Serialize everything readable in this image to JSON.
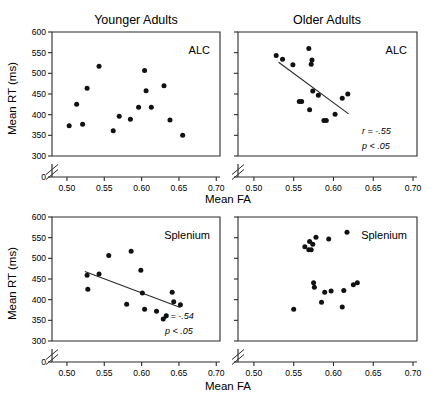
{
  "figure": {
    "name": "mean-rt-vs-mean-fa-scatter-matrix",
    "column_titles": [
      "Younger Adults",
      "Older Adults"
    ],
    "x_axis_label": "Mean FA",
    "y_axis_label": "Mean RT (ms)"
  },
  "axes": {
    "x_ticks": [
      "0.50",
      "0.55",
      "0.60",
      "0.65",
      "0.70"
    ],
    "x_tick_values": [
      0.5,
      0.55,
      0.6,
      0.65,
      0.7
    ],
    "x_min": 0.48,
    "x_max": 0.705,
    "y_ticks": [
      "0",
      "300",
      "350",
      "400",
      "450",
      "500",
      "550",
      "600"
    ],
    "y_tick_values": [
      0,
      300,
      350,
      400,
      450,
      500,
      550,
      600
    ],
    "y_min": 300,
    "y_max": 600,
    "axis_break": true,
    "grid": false
  },
  "chart_data": [
    {
      "type": "scatter",
      "panel": "top-left",
      "title": "Younger Adults",
      "roi_label": "ALC",
      "xlabel": "Mean FA",
      "ylabel": "Mean RT (ms)",
      "xlim": [
        0.48,
        0.705
      ],
      "ylim": [
        300,
        600
      ],
      "grid": false,
      "regression_line": null,
      "stats": null,
      "points": [
        {
          "x": 0.503,
          "y": 373
        },
        {
          "x": 0.513,
          "y": 425
        },
        {
          "x": 0.521,
          "y": 377
        },
        {
          "x": 0.527,
          "y": 464
        },
        {
          "x": 0.543,
          "y": 517
        },
        {
          "x": 0.562,
          "y": 361
        },
        {
          "x": 0.57,
          "y": 396
        },
        {
          "x": 0.585,
          "y": 389
        },
        {
          "x": 0.596,
          "y": 418
        },
        {
          "x": 0.604,
          "y": 507
        },
        {
          "x": 0.606,
          "y": 458
        },
        {
          "x": 0.613,
          "y": 418
        },
        {
          "x": 0.63,
          "y": 470
        },
        {
          "x": 0.638,
          "y": 387
        },
        {
          "x": 0.655,
          "y": 350
        }
      ]
    },
    {
      "type": "scatter",
      "panel": "top-right",
      "title": "Older Adults",
      "roi_label": "ALC",
      "xlabel": "Mean FA",
      "ylabel": "Mean RT (ms)",
      "xlim": [
        0.48,
        0.705
      ],
      "ylim": [
        300,
        600
      ],
      "grid": false,
      "regression_line": {
        "x1": 0.531,
        "y1": 527,
        "x2": 0.619,
        "y2": 402
      },
      "stats": {
        "r_label": "r = -.55",
        "p_label": "p < .05",
        "r": -0.55
      },
      "points": [
        {
          "x": 0.528,
          "y": 543
        },
        {
          "x": 0.536,
          "y": 534
        },
        {
          "x": 0.549,
          "y": 521
        },
        {
          "x": 0.557,
          "y": 432
        },
        {
          "x": 0.56,
          "y": 432
        },
        {
          "x": 0.569,
          "y": 560
        },
        {
          "x": 0.57,
          "y": 412
        },
        {
          "x": 0.572,
          "y": 522
        },
        {
          "x": 0.573,
          "y": 532
        },
        {
          "x": 0.574,
          "y": 457
        },
        {
          "x": 0.581,
          "y": 447
        },
        {
          "x": 0.588,
          "y": 386
        },
        {
          "x": 0.591,
          "y": 386
        },
        {
          "x": 0.602,
          "y": 401
        },
        {
          "x": 0.611,
          "y": 440
        },
        {
          "x": 0.618,
          "y": 450
        }
      ]
    },
    {
      "type": "scatter",
      "panel": "bottom-left",
      "title": "Younger Adults",
      "roi_label": "Splenium",
      "xlabel": "Mean FA",
      "ylabel": "Mean RT (ms)",
      "xlim": [
        0.48,
        0.705
      ],
      "ylim": [
        300,
        600
      ],
      "grid": false,
      "regression_line": {
        "x1": 0.524,
        "y1": 468,
        "x2": 0.652,
        "y2": 381
      },
      "stats": {
        "r_label": "r = -.54",
        "p_label": "p < .05",
        "r": -0.54
      },
      "points": [
        {
          "x": 0.527,
          "y": 459
        },
        {
          "x": 0.528,
          "y": 425
        },
        {
          "x": 0.543,
          "y": 462
        },
        {
          "x": 0.556,
          "y": 507
        },
        {
          "x": 0.58,
          "y": 389
        },
        {
          "x": 0.586,
          "y": 517
        },
        {
          "x": 0.599,
          "y": 471
        },
        {
          "x": 0.601,
          "y": 416
        },
        {
          "x": 0.604,
          "y": 377
        },
        {
          "x": 0.62,
          "y": 372
        },
        {
          "x": 0.629,
          "y": 353
        },
        {
          "x": 0.633,
          "y": 361
        },
        {
          "x": 0.641,
          "y": 418
        },
        {
          "x": 0.643,
          "y": 395
        },
        {
          "x": 0.652,
          "y": 388
        }
      ]
    },
    {
      "type": "scatter",
      "panel": "bottom-right",
      "title": "Older Adults",
      "roi_label": "Splenium",
      "xlabel": "Mean FA",
      "ylabel": "Mean RT (ms)",
      "xlim": [
        0.48,
        0.705
      ],
      "ylim": [
        300,
        600
      ],
      "grid": false,
      "regression_line": null,
      "stats": null,
      "points": [
        {
          "x": 0.55,
          "y": 377
        },
        {
          "x": 0.564,
          "y": 528
        },
        {
          "x": 0.569,
          "y": 521
        },
        {
          "x": 0.57,
          "y": 541
        },
        {
          "x": 0.572,
          "y": 521
        },
        {
          "x": 0.574,
          "y": 534
        },
        {
          "x": 0.575,
          "y": 441
        },
        {
          "x": 0.576,
          "y": 430
        },
        {
          "x": 0.578,
          "y": 551
        },
        {
          "x": 0.585,
          "y": 394
        },
        {
          "x": 0.589,
          "y": 418
        },
        {
          "x": 0.594,
          "y": 547
        },
        {
          "x": 0.597,
          "y": 421
        },
        {
          "x": 0.611,
          "y": 382
        },
        {
          "x": 0.613,
          "y": 422
        },
        {
          "x": 0.617,
          "y": 563
        },
        {
          "x": 0.625,
          "y": 436
        },
        {
          "x": 0.63,
          "y": 441
        }
      ]
    }
  ]
}
